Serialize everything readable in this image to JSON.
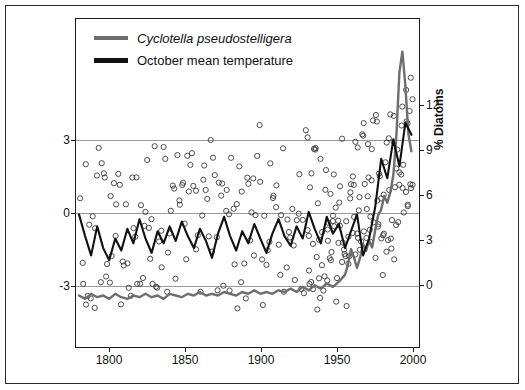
{
  "chart_data": {
    "type": "line",
    "title": "",
    "xlabel": "",
    "ylabel": "Deviation from mean (°C)",
    "y2label": "% Diatoms",
    "xlim": [
      1778,
      2005
    ],
    "ylim": [
      -5.2,
      8.4
    ],
    "y2lim": [
      -2.6,
      16.5
    ],
    "xticks": [
      1800,
      1850,
      1900,
      1950,
      2000
    ],
    "yticks": [
      -3,
      0,
      3
    ],
    "y2ticks": [
      0,
      3,
      6,
      9,
      12
    ],
    "grid": true,
    "legend_position": "top-left",
    "series": [
      {
        "name": "Cyclotella pseudostelligera",
        "color": "#6e6e6e",
        "axis": "right",
        "style": "line",
        "x": [
          1780,
          1784,
          1788,
          1792,
          1796,
          1800,
          1804,
          1808,
          1812,
          1816,
          1820,
          1824,
          1828,
          1832,
          1836,
          1840,
          1844,
          1848,
          1852,
          1856,
          1860,
          1864,
          1868,
          1872,
          1876,
          1880,
          1884,
          1888,
          1892,
          1896,
          1900,
          1904,
          1908,
          1912,
          1916,
          1920,
          1924,
          1928,
          1932,
          1936,
          1940,
          1944,
          1948,
          1952,
          1956,
          1958,
          1960,
          1962,
          1964,
          1966,
          1968,
          1970,
          1972,
          1974,
          1976,
          1978,
          1980,
          1982,
          1984,
          1986,
          1988,
          1990,
          1992,
          1994,
          1996,
          1998,
          2000
        ],
        "values": [
          0.4,
          0.2,
          0.5,
          0.3,
          0.4,
          0.2,
          0.5,
          0.3,
          0.2,
          0.4,
          0.3,
          0.5,
          0.3,
          0.4,
          0.2,
          0.5,
          0.4,
          0.3,
          0.5,
          0.4,
          0.6,
          0.4,
          0.5,
          0.4,
          0.6,
          0.5,
          0.4,
          0.6,
          0.5,
          0.7,
          0.5,
          0.6,
          0.5,
          0.7,
          0.6,
          0.8,
          0.6,
          0.9,
          0.7,
          1.0,
          0.8,
          1.1,
          0.9,
          1.2,
          1.6,
          2.2,
          3.1,
          2.6,
          2.0,
          2.6,
          3.4,
          3.0,
          3.6,
          3.2,
          4.2,
          5.1,
          5.4,
          6.2,
          5.8,
          6.4,
          7.4,
          9.6,
          13.4,
          14.6,
          12.6,
          9.8,
          8.8
        ]
      },
      {
        "name": "October mean temperature",
        "color": "#111111",
        "axis": "left",
        "style": "line",
        "x": [
          1780,
          1784,
          1788,
          1792,
          1796,
          1800,
          1804,
          1808,
          1812,
          1816,
          1820,
          1824,
          1828,
          1832,
          1836,
          1840,
          1844,
          1848,
          1852,
          1856,
          1860,
          1864,
          1868,
          1872,
          1876,
          1880,
          1884,
          1888,
          1892,
          1896,
          1900,
          1904,
          1908,
          1912,
          1916,
          1920,
          1924,
          1928,
          1932,
          1936,
          1940,
          1944,
          1948,
          1952,
          1956,
          1960,
          1964,
          1968,
          1972,
          1976,
          1980,
          1984,
          1988,
          1992,
          1996,
          2000
        ],
        "values": [
          0.3,
          -0.6,
          -1.4,
          -0.2,
          -1.1,
          -1.6,
          -0.7,
          -1.2,
          -0.3,
          -0.9,
          0.1,
          -0.7,
          -1.3,
          -0.4,
          -0.9,
          -0.2,
          -0.8,
          0.0,
          -0.6,
          -1.1,
          -0.3,
          -0.8,
          -1.5,
          -0.5,
          0.2,
          -0.6,
          -1.2,
          -0.4,
          -0.9,
          -0.1,
          -0.7,
          -1.3,
          -0.5,
          0.1,
          -0.6,
          -1.0,
          -0.2,
          -0.7,
          0.4,
          -0.3,
          -0.9,
          0.2,
          -0.5,
          -0.1,
          -1.1,
          -0.4,
          0.3,
          -1.4,
          -0.7,
          0.6,
          2.6,
          1.8,
          3.4,
          2.3,
          4.1,
          3.6
        ]
      },
      {
        "name": "scatter-points",
        "color": "#333333",
        "axis": "left",
        "style": "open-circles",
        "note": "Scattered open circles of annual values spread across the full plot area"
      }
    ]
  },
  "legend": {
    "items": [
      {
        "label": "Cyclotella pseudostelligera",
        "color": "#6e6e6e",
        "italic": true
      },
      {
        "label": "October mean temperature",
        "color": "#111111",
        "italic": false
      }
    ]
  },
  "axes": {
    "left": {
      "title": "Deviation from mean (°C)",
      "ticks": [
        "3",
        "0",
        "-3"
      ]
    },
    "right": {
      "title": "% Diatoms",
      "ticks": [
        "12",
        "9",
        "6",
        "3",
        "0"
      ]
    },
    "bottom": {
      "ticks": [
        "1800",
        "1850",
        "1900",
        "1950",
        "2000"
      ]
    }
  }
}
